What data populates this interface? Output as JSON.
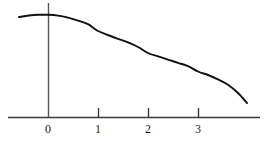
{
  "chart_data": {
    "type": "line",
    "title": "",
    "subtitle": "",
    "xlabel": "",
    "ylabel": "",
    "legend": [],
    "grid": false,
    "legend_position": "none",
    "xlim": [
      -0.8,
      4.24
    ],
    "ylim": [
      0,
      1.14
    ],
    "xticks": [
      0,
      1,
      2,
      3
    ],
    "xtick_labels": [
      "0",
      "1",
      "2",
      "3"
    ],
    "yticks": [],
    "ytick_labels": [],
    "axes": {
      "x_axis_shown": true,
      "y_axis_shown": true,
      "x_axis_color": "#3a3a3a",
      "y_axis_color": "#555555",
      "x_axis_pixel_y": 117,
      "y_axis_pixel_x": 48,
      "x_axis_pixel_start": 8,
      "x_axis_pixel_end": 260,
      "y_axis_pixel_top": 3,
      "tick_length_px": 9,
      "tick_spacing_px": 50
    },
    "series": [
      {
        "name": "curve",
        "color": "#111111",
        "line_width": 1.9,
        "x": [
          -0.58,
          -0.4,
          -0.2,
          0.0,
          0.2,
          0.4,
          0.6,
          0.8,
          1.0,
          1.2,
          1.4,
          1.6,
          1.8,
          2.0,
          2.2,
          2.4,
          2.6,
          2.8,
          3.0,
          3.2,
          3.4,
          3.6,
          3.8,
          3.98
        ],
        "y": [
          0.975,
          0.998,
          1.008,
          1.008,
          0.996,
          0.968,
          0.926,
          0.876,
          0.838,
          0.802,
          0.766,
          0.728,
          0.688,
          0.644,
          0.604,
          0.568,
          0.534,
          0.502,
          0.45,
          0.41,
          0.365,
          0.31,
          0.22,
          0.12
        ],
        "pixel_points": [
          [
            19,
            17
          ],
          [
            29,
            15.5
          ],
          [
            39,
            14.8
          ],
          [
            48,
            14.8
          ],
          [
            58,
            15.6
          ],
          [
            68,
            17.6
          ],
          [
            78,
            20.6
          ],
          [
            88,
            24.2
          ],
          [
            98,
            31.0
          ],
          [
            108,
            35.0
          ],
          [
            118,
            38.8
          ],
          [
            128,
            42.4
          ],
          [
            138,
            47.0
          ],
          [
            148,
            53.0
          ],
          [
            158,
            56.4
          ],
          [
            168,
            59.6
          ],
          [
            178,
            62.8
          ],
          [
            188,
            66.2
          ],
          [
            198,
            71.5
          ],
          [
            208,
            75.0
          ],
          [
            218,
            79.4
          ],
          [
            228,
            84.8
          ],
          [
            238,
            93.0
          ],
          [
            247,
            103.0
          ]
        ]
      }
    ],
    "annotations": []
  },
  "figure": {
    "background_color": "#ffffff",
    "width_px": 267,
    "height_px": 147
  }
}
